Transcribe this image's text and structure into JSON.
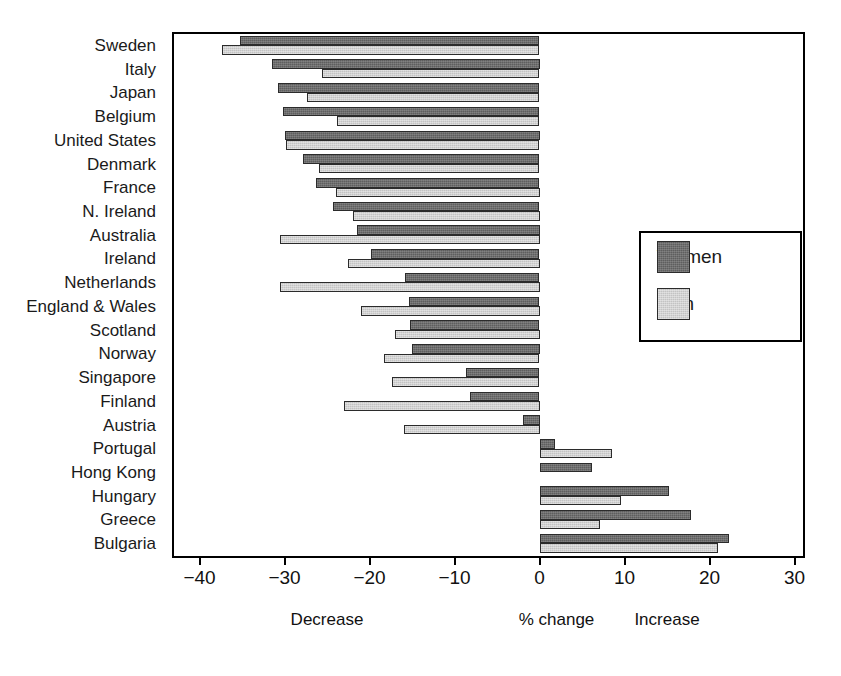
{
  "chart_data": {
    "type": "bar",
    "orientation": "horizontal",
    "title": "",
    "subtitle": "",
    "xlabel": "% change",
    "ylabel": "",
    "xlim": [
      -43,
      31
    ],
    "xticks": [
      -40,
      -30,
      -20,
      -10,
      0,
      10,
      20,
      30
    ],
    "xticklabels": [
      "−40",
      "−30",
      "−20",
      "−10",
      "0",
      "10",
      "20",
      "30"
    ],
    "grid": false,
    "legend_position": "center-right",
    "annotations": [
      {
        "text": "Decrease",
        "x": -25
      },
      {
        "text": "% change",
        "x": 2
      },
      {
        "text": "Increase",
        "x": 15
      }
    ],
    "categories": [
      "Sweden",
      "Italy",
      "Japan",
      "Belgium",
      "United States",
      "Denmark",
      "France",
      "N. Ireland",
      "Australia",
      "Ireland",
      "Netherlands",
      "England & Wales",
      "Scotland",
      "Norway",
      "Singapore",
      "Finland",
      "Austria",
      "Portugal",
      "Hong Kong",
      "Hungary",
      "Greece",
      "Bulgaria"
    ],
    "series": [
      {
        "name": "Women",
        "color": "#5e5e5e",
        "values": [
          -35.2,
          -31.5,
          -30.8,
          -30.2,
          -30.0,
          -27.8,
          -26.3,
          -24.3,
          -21.5,
          -19.8,
          -15.8,
          -15.3,
          -15.2,
          -15.0,
          -8.6,
          -8.2,
          -2.0,
          1.8,
          6.2,
          15.2,
          17.8,
          22.3
        ]
      },
      {
        "name": "Men",
        "color": "#c3c3c3",
        "values": [
          -37.4,
          -25.6,
          -27.3,
          -23.8,
          -29.8,
          -25.9,
          -24.0,
          -22.0,
          -30.5,
          -22.5,
          -30.5,
          -21.0,
          -17.0,
          -18.3,
          -17.4,
          -23.0,
          -16.0,
          8.5,
          null,
          9.6,
          7.1,
          21.0
        ]
      }
    ]
  },
  "legend": {
    "items": [
      {
        "label": "Women",
        "swatch": "women-swatch"
      },
      {
        "label": "Men",
        "swatch": "men-swatch"
      }
    ]
  }
}
